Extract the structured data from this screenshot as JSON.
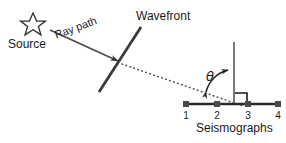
{
  "figure": {
    "title_labels": {
      "source": "Source",
      "ray_path": "Ray path",
      "wavefront": "Wavefront",
      "theta": "θ",
      "seismographs": "Seismographs"
    },
    "colors": {
      "stroke": "#333333",
      "wavefront": "#3a3a3a",
      "dotted": "#555555",
      "text": "#1a1a1a",
      "background": "#ffffff",
      "station_marker": "#4a4a4a"
    },
    "stations": [
      {
        "number": "1",
        "x": 186
      },
      {
        "number": "2",
        "x": 217
      },
      {
        "number": "3",
        "x": 248
      },
      {
        "number": "4",
        "x": 278
      }
    ],
    "geometry": {
      "source_star_center_x": 33,
      "source_star_center_y": 24,
      "ray_start_x": 50,
      "ray_start_y": 30,
      "ray_end_x": 120,
      "ray_end_y": 62,
      "wavefront_top_x": 141,
      "wavefront_top_y": 27,
      "wavefront_bottom_x": 99,
      "wavefront_bottom_y": 92,
      "dotted_start_x": 122,
      "dotted_start_y": 64,
      "dotted_end_x": 240,
      "dotted_end_y": 105,
      "normal_x": 234,
      "normal_top_y": 42,
      "normal_bottom_y": 104,
      "baseline_y": 104,
      "baseline_left_x": 186,
      "baseline_right_x": 278
    }
  }
}
